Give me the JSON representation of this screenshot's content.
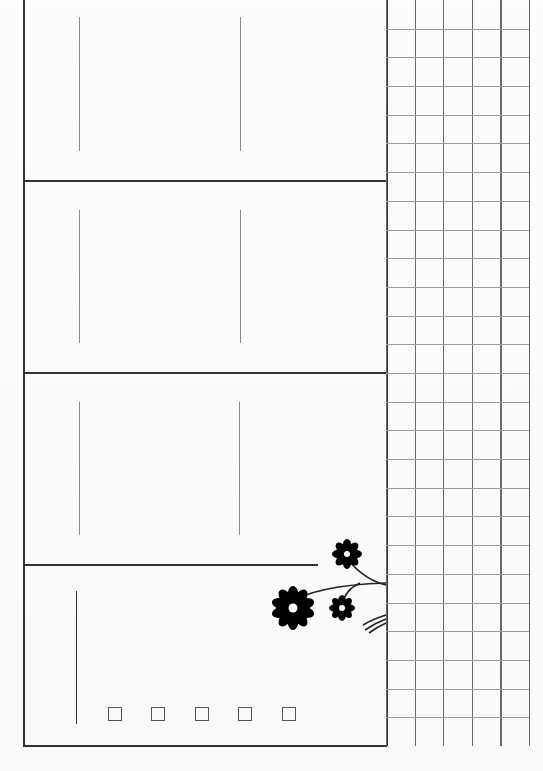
{
  "page": {
    "type": "blank planner sheet",
    "background_color": "#fbfbfa",
    "line_color": "#333333"
  },
  "sections": [
    {
      "id": "section-1",
      "top": 0,
      "bottom": 181,
      "dividers_x": [
        79,
        240
      ]
    },
    {
      "id": "section-2",
      "top": 181,
      "bottom": 373,
      "dividers_x": [
        79,
        240
      ]
    },
    {
      "id": "section-3",
      "top": 373,
      "bottom": 565,
      "dividers_x": [
        79,
        240
      ]
    },
    {
      "id": "section-4",
      "top": 565,
      "bottom": 746,
      "dividers_x": [
        77
      ]
    }
  ],
  "grid": {
    "columns": 5,
    "rows": 26,
    "line_color": "#6a6a6a"
  },
  "checkboxes": [
    {
      "id": "checkbox-1",
      "checked": false
    },
    {
      "id": "checkbox-2",
      "checked": false
    },
    {
      "id": "checkbox-3",
      "checked": false
    },
    {
      "id": "checkbox-4",
      "checked": false
    },
    {
      "id": "checkbox-5",
      "checked": false
    }
  ],
  "decoration": {
    "icon": "daisy-flowers-icon",
    "count": 3,
    "color": "#000000"
  }
}
